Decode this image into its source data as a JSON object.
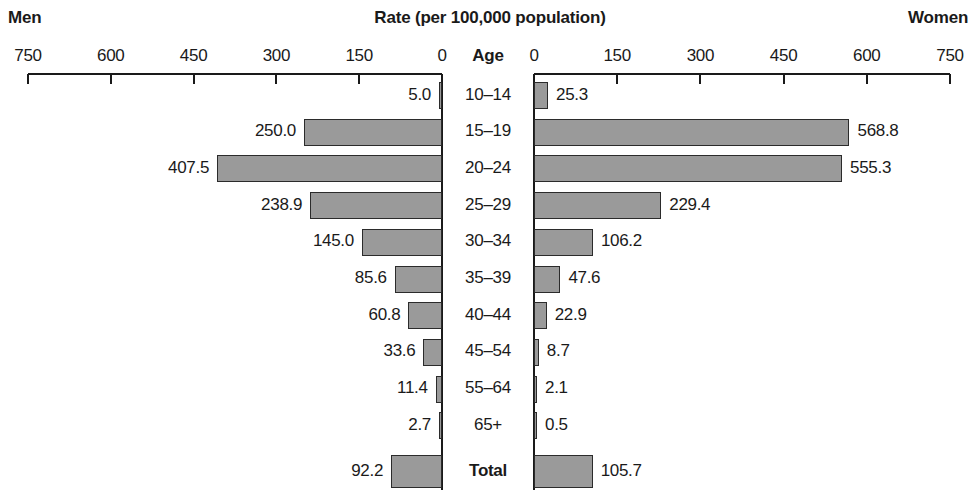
{
  "header": {
    "left_label": "Men",
    "right_label": "Women",
    "title": "Rate (per 100,000 population)",
    "center_axis_label": "Age"
  },
  "chart_data": {
    "type": "bar",
    "subtype": "population-pyramid",
    "title": "Rate (per 100,000 population)",
    "xlabel": "Rate (per 100,000 population)",
    "ylabel": "Age",
    "grid": false,
    "legend": "none",
    "axis_ticks_left": [
      "750",
      "600",
      "450",
      "300",
      "150",
      "0"
    ],
    "axis_ticks_right": [
      "0",
      "150",
      "300",
      "450",
      "600",
      "750"
    ],
    "xlim": [
      0,
      750
    ],
    "tick_step": 150,
    "categories": [
      "10–14",
      "15–19",
      "20–24",
      "25–29",
      "30–34",
      "35–39",
      "40–44",
      "45–54",
      "55–64",
      "65+",
      "Total"
    ],
    "series": [
      {
        "name": "Men",
        "side": "left",
        "values": [
          5.0,
          250.0,
          407.5,
          238.9,
          145.0,
          85.6,
          60.8,
          33.6,
          11.4,
          2.7,
          92.2
        ],
        "labels": [
          "5.0",
          "250.0",
          "407.5",
          "238.9",
          "145.0",
          "85.6",
          "60.8",
          "33.6",
          "11.4",
          "2.7",
          "92.2"
        ]
      },
      {
        "name": "Women",
        "side": "right",
        "values": [
          25.3,
          568.8,
          555.3,
          229.4,
          106.2,
          47.6,
          22.9,
          8.7,
          2.1,
          0.5,
          105.7
        ],
        "labels": [
          "25.3",
          "568.8",
          "555.3",
          "229.4",
          "106.2",
          "47.6",
          "22.9",
          "8.7",
          "2.1",
          "0.5",
          "105.7"
        ]
      }
    ],
    "colors": {
      "bar_fill": "#9a9a9a",
      "bar_stroke": "#2b2b2b",
      "axis": "#1a1a1a",
      "text": "#1a1a1a",
      "background": "#ffffff"
    }
  }
}
